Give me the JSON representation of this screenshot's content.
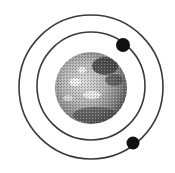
{
  "diagram": {
    "title": "",
    "background": "#ffffff",
    "planet": {
      "cx": 91,
      "cy": 88,
      "r": 36,
      "fill_light": "#d9d9d9",
      "fill_mid": "#9a9a9a",
      "fill_dark": "#3a3a3a"
    },
    "orbits": [
      {
        "name": "inner-orbit",
        "cx": 91,
        "cy": 86,
        "r": 54,
        "stroke": "#3a3a3a"
      },
      {
        "name": "outer-orbit",
        "cx": 91,
        "cy": 87,
        "r": 72,
        "stroke": "#3a3a3a"
      }
    ],
    "moons": [
      {
        "name": "moon-inner",
        "cx": 123,
        "cy": 45,
        "r": 7,
        "fill": "#111111"
      },
      {
        "name": "moon-outer",
        "cx": 133,
        "cy": 143,
        "r": 6.5,
        "fill": "#111111"
      }
    ]
  }
}
